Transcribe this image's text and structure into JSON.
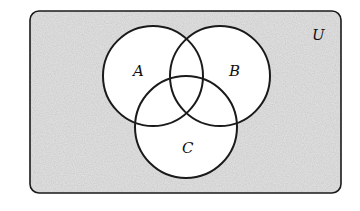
{
  "diagram": {
    "type": "venn",
    "universe_label": "U",
    "sets": [
      {
        "label": "A"
      },
      {
        "label": "B"
      },
      {
        "label": "C"
      }
    ],
    "colors": {
      "universe_fill": "#d4d4d4",
      "circle_fill": "#ffffff",
      "stroke": "#1a1a1a"
    }
  }
}
